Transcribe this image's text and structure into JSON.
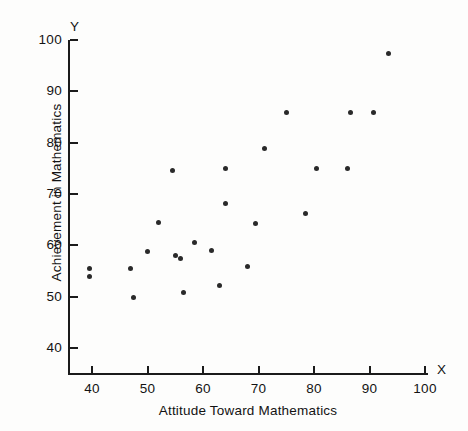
{
  "chart_data": {
    "type": "scatter",
    "title": "",
    "xlabel": "Attitude Toward Mathematics",
    "ylabel": "Achievement in Mathematics",
    "x_axis_symbol": "X",
    "y_axis_symbol": "Y",
    "xlim": [
      36,
      103
    ],
    "ylim": [
      36,
      101
    ],
    "xticks": [
      40,
      50,
      60,
      70,
      80,
      90,
      100
    ],
    "yticks": [
      40,
      50,
      60,
      70,
      80,
      90,
      100
    ],
    "xtick_labels": [
      "40",
      "50",
      "60",
      "70",
      "80",
      "90",
      "100"
    ],
    "ytick_labels": [
      "40",
      "50",
      "60",
      "70",
      "80",
      "90",
      "100"
    ],
    "grid": false,
    "legend": null,
    "marker": "filled-circle",
    "marker_color": "#2a2a2a",
    "axis_color": "#1b1b1b",
    "background_color": "#fdfdfc",
    "points": [
      {
        "x": 39.5,
        "y": 55.5
      },
      {
        "x": 39.5,
        "y": 54.0
      },
      {
        "x": 47.0,
        "y": 55.5
      },
      {
        "x": 47.5,
        "y": 49.8
      },
      {
        "x": 50.0,
        "y": 58.8
      },
      {
        "x": 52.0,
        "y": 64.5
      },
      {
        "x": 54.5,
        "y": 74.5
      },
      {
        "x": 55.0,
        "y": 58.0
      },
      {
        "x": 56.0,
        "y": 57.5
      },
      {
        "x": 56.5,
        "y": 50.8
      },
      {
        "x": 58.5,
        "y": 60.5
      },
      {
        "x": 61.5,
        "y": 59.0
      },
      {
        "x": 63.0,
        "y": 52.2
      },
      {
        "x": 64.0,
        "y": 75.0
      },
      {
        "x": 64.0,
        "y": 68.2
      },
      {
        "x": 68.0,
        "y": 55.8
      },
      {
        "x": 69.5,
        "y": 64.2
      },
      {
        "x": 71.0,
        "y": 78.8
      },
      {
        "x": 75.0,
        "y": 85.9
      },
      {
        "x": 78.5,
        "y": 66.2
      },
      {
        "x": 80.5,
        "y": 75.0
      },
      {
        "x": 86.0,
        "y": 75.0
      },
      {
        "x": 86.5,
        "y": 85.9
      },
      {
        "x": 90.8,
        "y": 85.9
      },
      {
        "x": 93.5,
        "y": 97.4
      }
    ]
  }
}
